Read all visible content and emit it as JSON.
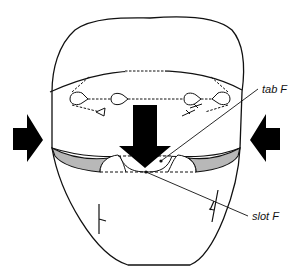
{
  "diagram": {
    "labels": {
      "tab": "tab F",
      "slot": "slot F"
    },
    "arrows": [
      {
        "id": "left-arrow",
        "direction": "right",
        "meaning": "push inward from left"
      },
      {
        "id": "right-arrow",
        "direction": "left",
        "meaning": "push inward from right"
      },
      {
        "id": "center-arrow",
        "direction": "down",
        "meaning": "insert tab downward into slot"
      }
    ],
    "colors": {
      "stroke": "#111111",
      "fill_band": "#b8b8b8",
      "arrow": "#000000",
      "background": "#ffffff"
    }
  }
}
